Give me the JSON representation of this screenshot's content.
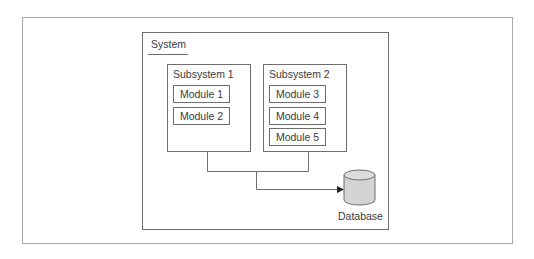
{
  "diagram": {
    "system": {
      "label": "System"
    },
    "subsystems": [
      {
        "label": "Subsystem 1",
        "modules": [
          "Module 1",
          "Module 2"
        ]
      },
      {
        "label": "Subsystem 2",
        "modules": [
          "Module 3",
          "Module 4",
          "Module 5"
        ]
      }
    ],
    "database": {
      "label": "Database",
      "fill": "#d4d4d4"
    },
    "edges": [
      {
        "from": "Subsystem 1",
        "to": "Database"
      },
      {
        "from": "Subsystem 2",
        "to": "Database"
      }
    ],
    "colors": {
      "border": "#6e6e6e",
      "frame": "#a9a9a9",
      "text": "#3a3a3a",
      "db_fill": "#d4d4d4"
    }
  }
}
